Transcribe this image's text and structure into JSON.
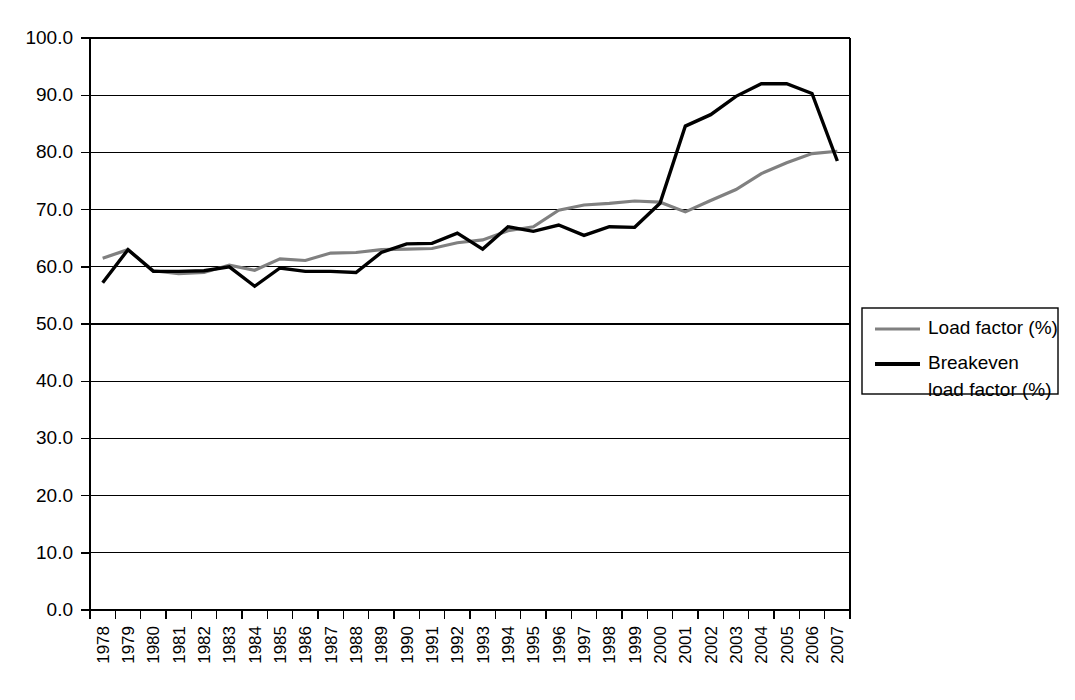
{
  "chart_data": {
    "type": "line",
    "title": "",
    "subtitle": "",
    "xlabel": "",
    "ylabel": "",
    "ylim": [
      0.0,
      100.0
    ],
    "ytick_step": 10.0,
    "ytick_labels": [
      "0.0",
      "10.0",
      "20.0",
      "30.0",
      "40.0",
      "50.0",
      "60.0",
      "70.0",
      "80.0",
      "90.0",
      "100.0"
    ],
    "grid": true,
    "grid_axis": "y",
    "legend_position": "right",
    "categories": [
      "1978",
      "1979",
      "1980",
      "1981",
      "1982",
      "1983",
      "1984",
      "1985",
      "1986",
      "1987",
      "1988",
      "1989",
      "1990",
      "1991",
      "1992",
      "1993",
      "1994",
      "1995",
      "1996",
      "1997",
      "1998",
      "1999",
      "2000",
      "2001",
      "2002",
      "2003",
      "2004",
      "2005",
      "2006",
      "2007"
    ],
    "series": [
      {
        "name": "Load factor (%)",
        "color": "#808080",
        "stroke_width": 3.2,
        "values": [
          61.5,
          63.0,
          59.3,
          58.8,
          59.0,
          60.3,
          59.4,
          61.4,
          61.1,
          62.4,
          62.5,
          63.0,
          63.1,
          63.2,
          64.2,
          64.7,
          66.3,
          67.0,
          69.9,
          70.8,
          71.1,
          71.5,
          71.3,
          69.6,
          71.6,
          73.5,
          76.3,
          78.2,
          79.8,
          80.2
        ]
      },
      {
        "name": "Breakeven load factor (%)",
        "color": "#000000",
        "stroke_width": 3.4,
        "values": [
          57.2,
          63.0,
          59.2,
          59.2,
          59.3,
          60.0,
          56.6,
          59.8,
          59.2,
          59.2,
          59.0,
          62.5,
          64.0,
          64.1,
          65.9,
          63.1,
          67.0,
          66.2,
          67.3,
          65.5,
          67.0,
          66.9,
          71.1,
          84.6,
          86.6,
          89.8,
          92.0,
          92.0,
          90.3,
          78.5
        ]
      }
    ],
    "legend_entries": [
      {
        "label": "Load factor (%)",
        "label_lines": [
          "Load factor (%)"
        ],
        "color": "#808080"
      },
      {
        "label": "Breakeven load factor (%)",
        "label_lines": [
          "Breakeven",
          "load factor (%)"
        ],
        "color": "#000000"
      }
    ]
  }
}
